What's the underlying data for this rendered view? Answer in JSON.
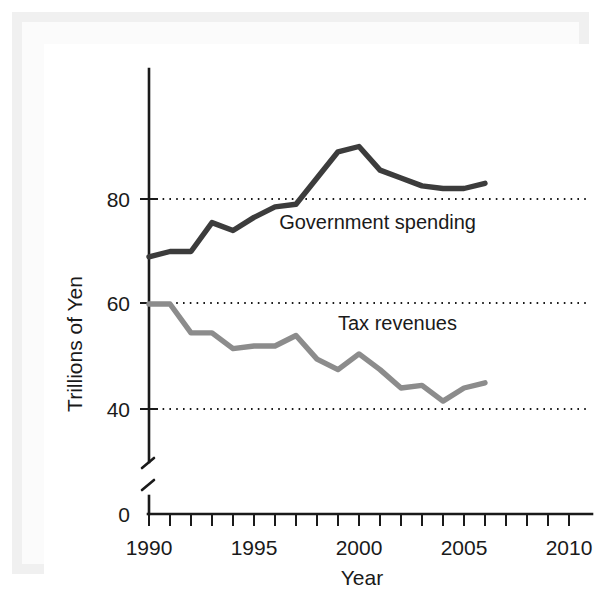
{
  "chart_data": {
    "type": "line",
    "title": "",
    "xlabel": "Year",
    "ylabel": "Trillions of Yen",
    "xlim": [
      1990,
      2010.8
    ],
    "ylim": [
      38,
      93
    ],
    "y_axis_break": true,
    "y_break_label": "0",
    "grid": "horizontal-dotted",
    "legend_position": "inline-annotations",
    "x": [
      1990,
      1991,
      1992,
      1993,
      1994,
      1995,
      1996,
      1997,
      1998,
      1999,
      2000,
      2001,
      2002,
      2003,
      2004,
      2005,
      2006
    ],
    "xticks_major": [
      1990,
      1995,
      2000,
      2005,
      2010
    ],
    "xtick_labels": [
      "1990",
      "1995",
      "2000",
      "2005",
      "2010"
    ],
    "xticks_minor_step": 1,
    "yticks": [
      40,
      60,
      80
    ],
    "ytick_labels": [
      "40",
      "60",
      "80"
    ],
    "ybreak_tick_label": "0",
    "series": [
      {
        "name": "Government spending",
        "color": "#3c3c3c",
        "label_x": 1996.2,
        "label_y": 74.2,
        "values": [
          69,
          70,
          70,
          75.5,
          74,
          76.5,
          78.5,
          79,
          84,
          89,
          90,
          85.5,
          84,
          82.5,
          82,
          82,
          83
        ]
      },
      {
        "name": "Tax revenues",
        "color": "#8c8c8c",
        "label_x": 1999.0,
        "label_y": 55.0,
        "values": [
          60,
          60,
          54.5,
          54.5,
          51.5,
          52,
          52,
          54,
          49.5,
          47.5,
          50.5,
          47.5,
          44,
          44.5,
          41.5,
          44,
          45
        ]
      }
    ]
  },
  "colors": {
    "spending": "#3c3c3c",
    "revenues": "#8c8c8c",
    "axis": "#1a1a1a",
    "frame": "#f0f0f0",
    "plot_background": "#ffffff"
  }
}
